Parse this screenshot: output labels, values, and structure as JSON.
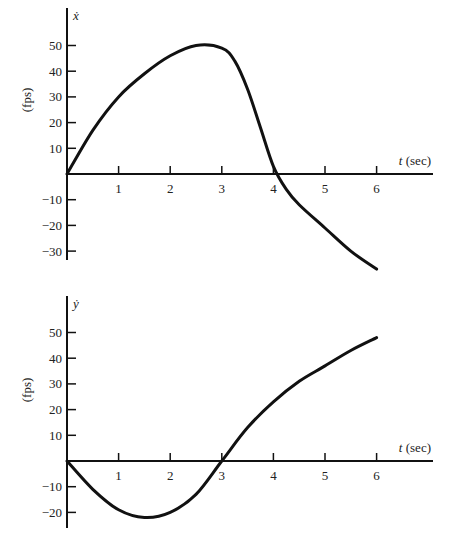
{
  "chart_data": [
    {
      "type": "line",
      "title": "",
      "ylabel_symbol": "ẋ",
      "ylabel_units": "(fps)",
      "xlabel": "t (sec)",
      "x_ticks": [
        1,
        2,
        3,
        4,
        5,
        6
      ],
      "y_ticks": [
        50,
        40,
        30,
        20,
        10,
        -10,
        -20,
        -30
      ],
      "y_tick_labels": [
        "50",
        "40",
        "30",
        "20",
        "10",
        "−10",
        "−20",
        "−30"
      ],
      "xlim": [
        0,
        7
      ],
      "ylim": [
        -33,
        57
      ],
      "grid": false,
      "legend": null,
      "series": [
        {
          "name": "x-dot",
          "x": [
            0,
            0.5,
            1,
            1.5,
            2,
            2.5,
            3,
            3.25,
            3.5,
            3.75,
            4,
            4.25,
            4.5,
            5,
            5.5,
            6
          ],
          "y": [
            0,
            17,
            30,
            39,
            46,
            50,
            49,
            44,
            33,
            18,
            3,
            -6,
            -12,
            -21,
            -30,
            -37
          ]
        }
      ]
    },
    {
      "type": "line",
      "title": "",
      "ylabel_symbol": "ẏ",
      "ylabel_units": "(fps)",
      "xlabel": "t (sec)",
      "x_ticks": [
        1,
        2,
        3,
        4,
        5,
        6
      ],
      "y_ticks": [
        50,
        40,
        30,
        20,
        10,
        -10,
        -20
      ],
      "y_tick_labels": [
        "50",
        "40",
        "30",
        "20",
        "10",
        "−10",
        "−20"
      ],
      "xlim": [
        0,
        7
      ],
      "ylim": [
        -25,
        57
      ],
      "grid": false,
      "legend": null,
      "series": [
        {
          "name": "y-dot",
          "x": [
            0,
            0.5,
            1,
            1.5,
            2,
            2.5,
            3,
            3.5,
            4,
            4.5,
            5,
            5.5,
            6
          ],
          "y": [
            0,
            -11,
            -19,
            -22,
            -20,
            -13,
            0,
            13,
            23,
            31,
            37,
            43,
            48
          ]
        }
      ]
    }
  ]
}
